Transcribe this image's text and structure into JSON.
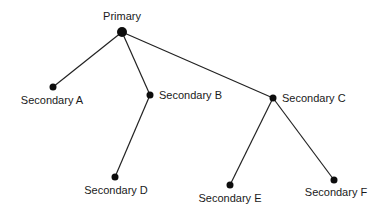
{
  "diagram": {
    "type": "tree",
    "colors": {
      "node": "#0d0d0d",
      "edge": "#222222",
      "text": "#1a1a1a",
      "background": "#ffffff"
    },
    "nodes": [
      {
        "id": "primary",
        "label": "Primary"
      },
      {
        "id": "a",
        "label": "Secondary A"
      },
      {
        "id": "b",
        "label": "Secondary B"
      },
      {
        "id": "c",
        "label": "Secondary C"
      },
      {
        "id": "d",
        "label": "Secondary D"
      },
      {
        "id": "e",
        "label": "Secondary E"
      },
      {
        "id": "f",
        "label": "Secondary F"
      }
    ],
    "edges": [
      {
        "from": "primary",
        "to": "a"
      },
      {
        "from": "primary",
        "to": "b"
      },
      {
        "from": "primary",
        "to": "c"
      },
      {
        "from": "b",
        "to": "d"
      },
      {
        "from": "c",
        "to": "e"
      },
      {
        "from": "c",
        "to": "f"
      }
    ]
  }
}
